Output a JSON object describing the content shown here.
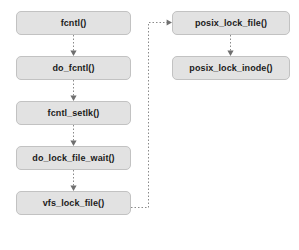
{
  "diagram": {
    "background_color": "#ffffff",
    "node_fill_color": "#e2e2e2",
    "node_border_color": "#c2c2c2",
    "connector_color": "#8a8a8a",
    "nodes": [
      {
        "id": "fcntl",
        "label": "fcntl()",
        "x": 16,
        "y": 11,
        "width": 115,
        "height": 24
      },
      {
        "id": "do_fcntl",
        "label": "do_fcntl()",
        "x": 16,
        "y": 56,
        "width": 115,
        "height": 24
      },
      {
        "id": "fcntl_setlk",
        "label": "fcntl_setlk()",
        "x": 16,
        "y": 101,
        "width": 115,
        "height": 24
      },
      {
        "id": "do_lock_file_wait",
        "label": "do_lock_file_wait()",
        "x": 16,
        "y": 146,
        "width": 115,
        "height": 24
      },
      {
        "id": "vfs_lock_file",
        "label": "vfs_lock_file()",
        "x": 16,
        "y": 191,
        "width": 115,
        "height": 24
      },
      {
        "id": "posix_lock_file",
        "label": "posix_lock_file()",
        "x": 172,
        "y": 11,
        "width": 118,
        "height": 24
      },
      {
        "id": "posix_lock_inode",
        "label": "posix_lock_inode()",
        "x": 172,
        "y": 56,
        "width": 118,
        "height": 24
      }
    ],
    "edges": [
      {
        "id": "e1",
        "from": "fcntl",
        "to": "do_fcntl",
        "style": "dotted",
        "arrow": "down"
      },
      {
        "id": "e2",
        "from": "do_fcntl",
        "to": "fcntl_setlk",
        "style": "dotted",
        "arrow": "down"
      },
      {
        "id": "e3",
        "from": "fcntl_setlk",
        "to": "do_lock_file_wait",
        "style": "dotted",
        "arrow": "down"
      },
      {
        "id": "e4",
        "from": "do_lock_file_wait",
        "to": "vfs_lock_file",
        "style": "dotted",
        "arrow": "down"
      },
      {
        "id": "e5",
        "from": "vfs_lock_file",
        "to": "posix_lock_file",
        "style": "dotted",
        "arrow": "right",
        "routing": "orthogonal"
      },
      {
        "id": "e6",
        "from": "posix_lock_file",
        "to": "posix_lock_inode",
        "style": "dotted",
        "arrow": "down"
      }
    ]
  }
}
